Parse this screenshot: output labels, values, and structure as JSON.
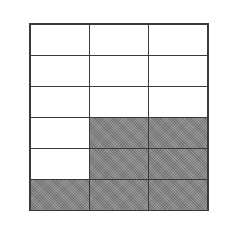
{
  "diagram": {
    "type": "fraction-grid",
    "rows": 6,
    "columns": 3,
    "total_cells": 18,
    "shaded_count": 7,
    "shaded_fraction": "7/18",
    "colors": {
      "shaded": "#8c8c8c",
      "unshaded": "#ffffff",
      "border": "#3a3a3a"
    },
    "cells": [
      [
        false,
        false,
        false
      ],
      [
        false,
        false,
        false
      ],
      [
        false,
        false,
        false
      ],
      [
        false,
        true,
        true
      ],
      [
        false,
        true,
        true
      ],
      [
        true,
        true,
        true
      ]
    ]
  }
}
